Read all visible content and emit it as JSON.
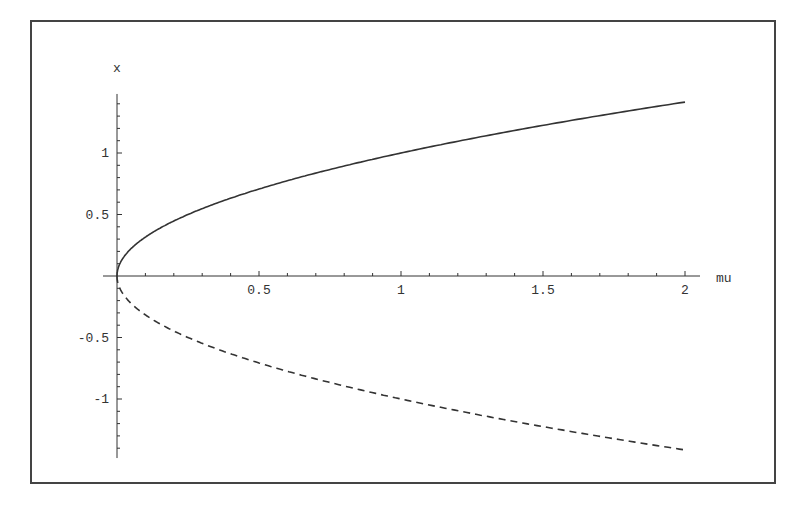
{
  "chart_data": {
    "type": "line",
    "title": "",
    "xlabel": "mu",
    "ylabel": "x",
    "xlim": [
      0,
      2
    ],
    "ylim": [
      -1.48,
      1.48
    ],
    "x_ticks": [
      "0.5",
      "1",
      "1.5",
      "2"
    ],
    "y_ticks": [
      "1",
      "0.5",
      "-0.5",
      "-1"
    ],
    "grid": false,
    "legend": null,
    "series": [
      {
        "name": "stable branch x = sqrt(mu)",
        "style": "solid",
        "x": [
          0,
          0.01,
          0.05,
          0.1,
          0.25,
          0.5,
          0.75,
          1,
          1.25,
          1.5,
          1.75,
          2
        ],
        "values": [
          0,
          0.1,
          0.224,
          0.316,
          0.5,
          0.707,
          0.866,
          1,
          1.118,
          1.225,
          1.323,
          1.414
        ]
      },
      {
        "name": "unstable branch x = -sqrt(mu)",
        "style": "dashed",
        "x": [
          0,
          0.01,
          0.05,
          0.1,
          0.25,
          0.5,
          0.75,
          1,
          1.25,
          1.5,
          1.75,
          2
        ],
        "values": [
          0,
          -0.1,
          -0.224,
          -0.316,
          -0.5,
          -0.707,
          -0.866,
          -1,
          -1.118,
          -1.225,
          -1.323,
          -1.414
        ]
      }
    ]
  },
  "axes": {
    "x_label": "mu",
    "y_label": "x",
    "x_tick_labels": [
      "0.5",
      "1",
      "1.5",
      "2"
    ],
    "y_tick_labels": [
      "1",
      "0.5",
      "-0.5",
      "-1"
    ]
  },
  "colors": {
    "line": "#333333",
    "frame": "#444444"
  }
}
